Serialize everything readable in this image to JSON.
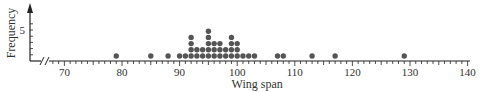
{
  "chart_data": {
    "type": "dot",
    "title": "",
    "xlabel": "Wing span",
    "ylabel": "Frequency",
    "xlim": [
      65,
      140
    ],
    "x_axis_break": true,
    "x_ticks": [
      70,
      80,
      90,
      100,
      110,
      120,
      130,
      140
    ],
    "y_ticks": [
      5
    ],
    "grid": false,
    "points": [
      {
        "x": 79,
        "count": 1
      },
      {
        "x": 85,
        "count": 1
      },
      {
        "x": 88,
        "count": 1
      },
      {
        "x": 90,
        "count": 1
      },
      {
        "x": 91,
        "count": 1
      },
      {
        "x": 92,
        "count": 4
      },
      {
        "x": 93,
        "count": 2
      },
      {
        "x": 94,
        "count": 2
      },
      {
        "x": 95,
        "count": 5
      },
      {
        "x": 96,
        "count": 3
      },
      {
        "x": 97,
        "count": 3
      },
      {
        "x": 98,
        "count": 2
      },
      {
        "x": 99,
        "count": 4
      },
      {
        "x": 100,
        "count": 3
      },
      {
        "x": 101,
        "count": 1
      },
      {
        "x": 102,
        "count": 1
      },
      {
        "x": 103,
        "count": 1
      },
      {
        "x": 107,
        "count": 1
      },
      {
        "x": 108,
        "count": 1
      },
      {
        "x": 113,
        "count": 1
      },
      {
        "x": 117,
        "count": 1
      },
      {
        "x": 129,
        "count": 1
      }
    ]
  },
  "colors": {
    "dot": "#555555",
    "axis": "#222222",
    "text": "#333333"
  }
}
